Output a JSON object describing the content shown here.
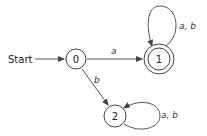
{
  "diagram": {
    "type": "finite-automaton",
    "start_label": "Start",
    "states": [
      {
        "id": "0",
        "label": "0",
        "accepting": false,
        "start": true
      },
      {
        "id": "1",
        "label": "1",
        "accepting": true,
        "start": false
      },
      {
        "id": "2",
        "label": "2",
        "accepting": false,
        "start": false
      }
    ],
    "transitions": [
      {
        "from": "0",
        "to": "1",
        "label": "a"
      },
      {
        "from": "0",
        "to": "2",
        "label": "b"
      },
      {
        "from": "1",
        "to": "1",
        "label": "a, b"
      },
      {
        "from": "2",
        "to": "2",
        "label": "a, b"
      }
    ],
    "colors": {
      "stroke": "#444444",
      "text": "#222222",
      "background": "#ffffff"
    }
  }
}
